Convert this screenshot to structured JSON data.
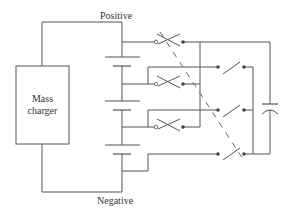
{
  "diagram": {
    "labels": {
      "positive": "Positive",
      "negative": "Negative",
      "charger_line1": "Mass",
      "charger_line2": "charger"
    },
    "components": {
      "charger": "Mass charger",
      "battery_cells": 3,
      "switch_banks": [
        {
          "name": "series-tap switches",
          "count": 3
        },
        {
          "name": "parallel-output switches",
          "count": 3
        }
      ],
      "capacitor": 1
    },
    "colors": {
      "line": "#555555",
      "background": "#ffffff",
      "text": "#333333"
    }
  }
}
